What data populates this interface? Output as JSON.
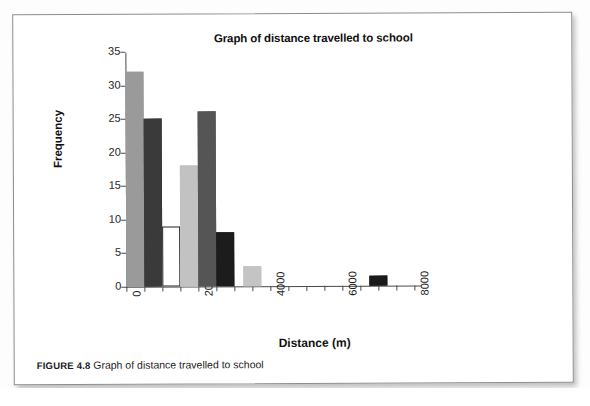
{
  "page": {
    "caption_label": "FIGURE 4.8",
    "caption_text": "Graph of distance travelled to school"
  },
  "chart_data": {
    "type": "bar",
    "title": "Graph of distance travelled to school",
    "xlabel": "Distance (m)",
    "ylabel": "Frequency",
    "xlim": [
      0,
      8000
    ],
    "ylim": [
      0,
      35
    ],
    "grid": false,
    "legend": null,
    "ytick_labels": [
      "0",
      "5",
      "10",
      "15",
      "20",
      "25",
      "30",
      "35"
    ],
    "ytick_values": [
      0,
      5,
      10,
      15,
      20,
      25,
      30,
      35
    ],
    "xtick_labels": [
      "0",
      "2000",
      "4000",
      "6000",
      "8000"
    ],
    "xtick_values": [
      0,
      2000,
      4000,
      6000,
      8000
    ],
    "xtick_minor_step": 500,
    "bin_width": 500,
    "bars": [
      {
        "bin_start": 0,
        "bin_end": 500,
        "value": 32,
        "color": "#9a9a9a"
      },
      {
        "bin_start": 500,
        "bin_end": 1000,
        "value": 25,
        "color": "#3a3a3a"
      },
      {
        "bin_start": 1000,
        "bin_end": 1500,
        "value": 9,
        "color": "#ffffff"
      },
      {
        "bin_start": 1500,
        "bin_end": 2000,
        "value": 18,
        "color": "#c2c2c2"
      },
      {
        "bin_start": 2000,
        "bin_end": 2500,
        "value": 26,
        "color": "#555555"
      },
      {
        "bin_start": 2500,
        "bin_end": 3000,
        "value": 8,
        "color": "#1c1c1c"
      },
      {
        "bin_start": 3250,
        "bin_end": 3750,
        "value": 3,
        "color": "#c4c4c4"
      },
      {
        "bin_start": 6750,
        "bin_end": 7250,
        "value": 1.5,
        "color": "#1a1a1a"
      }
    ],
    "categories": [
      "0-500",
      "500-1000",
      "1000-1500",
      "1500-2000",
      "2000-2500",
      "2500-3000",
      "3250-3750",
      "6750-7250"
    ],
    "values": [
      32,
      25,
      9,
      18,
      26,
      8,
      3,
      1.5
    ]
  }
}
